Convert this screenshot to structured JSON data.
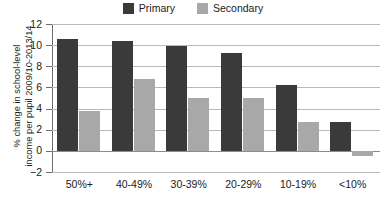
{
  "chart_data": {
    "type": "bar",
    "title": "",
    "subtitle": "",
    "xlabel": "",
    "ylabel": "% change in school-level income per pupil 2009/10-2013/14",
    "ylabel_lines": [
      "% change in school-level",
      "income per pupil 2009/10-2013/14"
    ],
    "categories": [
      "50%+",
      "40-49%",
      "30-39%",
      "20-29%",
      "10-19%",
      "<10%"
    ],
    "series": [
      {
        "name": "Primary",
        "color": "#3a3a3a",
        "values": [
          10.6,
          10.4,
          9.9,
          9.3,
          6.2,
          2.7
        ]
      },
      {
        "name": "Secondary",
        "color": "#a8a8a8",
        "values": [
          3.8,
          6.8,
          5.0,
          5.0,
          2.7,
          -0.5
        ]
      }
    ],
    "ylim": [
      -2,
      12
    ],
    "ytick_values": [
      12,
      10,
      8,
      6,
      4,
      2,
      0,
      -2
    ],
    "ytick_labels": [
      "12",
      "10",
      "8",
      "6",
      "4",
      "2",
      "0",
      "−2"
    ],
    "grid": true,
    "grid_axis": "y",
    "zero_line": 0,
    "legend": {
      "position": "top-center",
      "entries": [
        {
          "label": "Primary",
          "color": "#3a3a3a"
        },
        {
          "label": "Secondary",
          "color": "#a8a8a8"
        }
      ]
    },
    "colors": {
      "primary": "#3a3a3a",
      "secondary": "#a8a8a8",
      "grid": "#b9b9b9",
      "axis": "#6e6e6e",
      "zero_line": "#8c8c8c",
      "background": "#ffffff",
      "text": "#1a1a1a"
    }
  }
}
